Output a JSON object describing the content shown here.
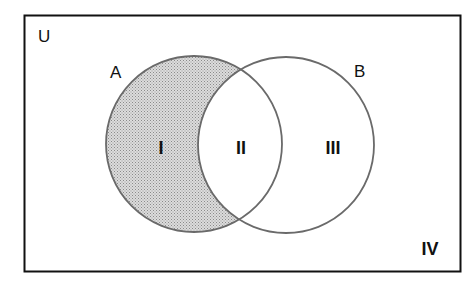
{
  "diagram": {
    "type": "venn",
    "universe": {
      "label": "U"
    },
    "sets": [
      {
        "id": "A",
        "label": "A",
        "shaded_part": "A only (region I)"
      },
      {
        "id": "B",
        "label": "B"
      }
    ],
    "regions": [
      {
        "label": "I",
        "description": "A only",
        "shaded": true
      },
      {
        "label": "II",
        "description": "A and B",
        "shaded": false
      },
      {
        "label": "III",
        "description": "B only",
        "shaded": false
      },
      {
        "label": "IV",
        "description": "neither A nor B",
        "shaded": false
      }
    ],
    "colors": {
      "outline": "#111111",
      "circle_stroke": "#6a6a6a",
      "shade": "#c8c8c8",
      "background": "#ffffff"
    }
  }
}
